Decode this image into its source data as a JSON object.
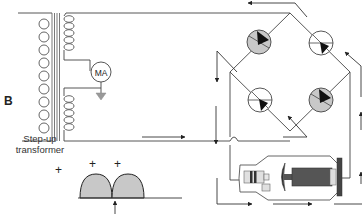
{
  "figure": {
    "panel_letter": "B",
    "transformer": {
      "label_line1": "Step-up",
      "label_line2": "transformer"
    },
    "meter": {
      "label": "MA"
    },
    "waveform": {
      "plus_signs": [
        "+",
        "+",
        "+"
      ],
      "pulses": 2,
      "description": "full-wave rectified pulses"
    },
    "rectifier": {
      "diodes": [
        {
          "position": "top-left",
          "state": "conducting",
          "fill": "#c8c8c8"
        },
        {
          "position": "top-right",
          "state": "non-conducting",
          "fill": "#ffffff"
        },
        {
          "position": "bottom-left",
          "state": "non-conducting",
          "fill": "#ffffff"
        },
        {
          "position": "bottom-right",
          "state": "conducting",
          "fill": "#c8c8c8"
        }
      ]
    },
    "xray_tube": {
      "components": [
        "cathode",
        "anode",
        "rotor"
      ]
    },
    "colors": {
      "line": "#444444",
      "conducting_fill": "#c8c8c8",
      "background": "#ffffff"
    }
  }
}
